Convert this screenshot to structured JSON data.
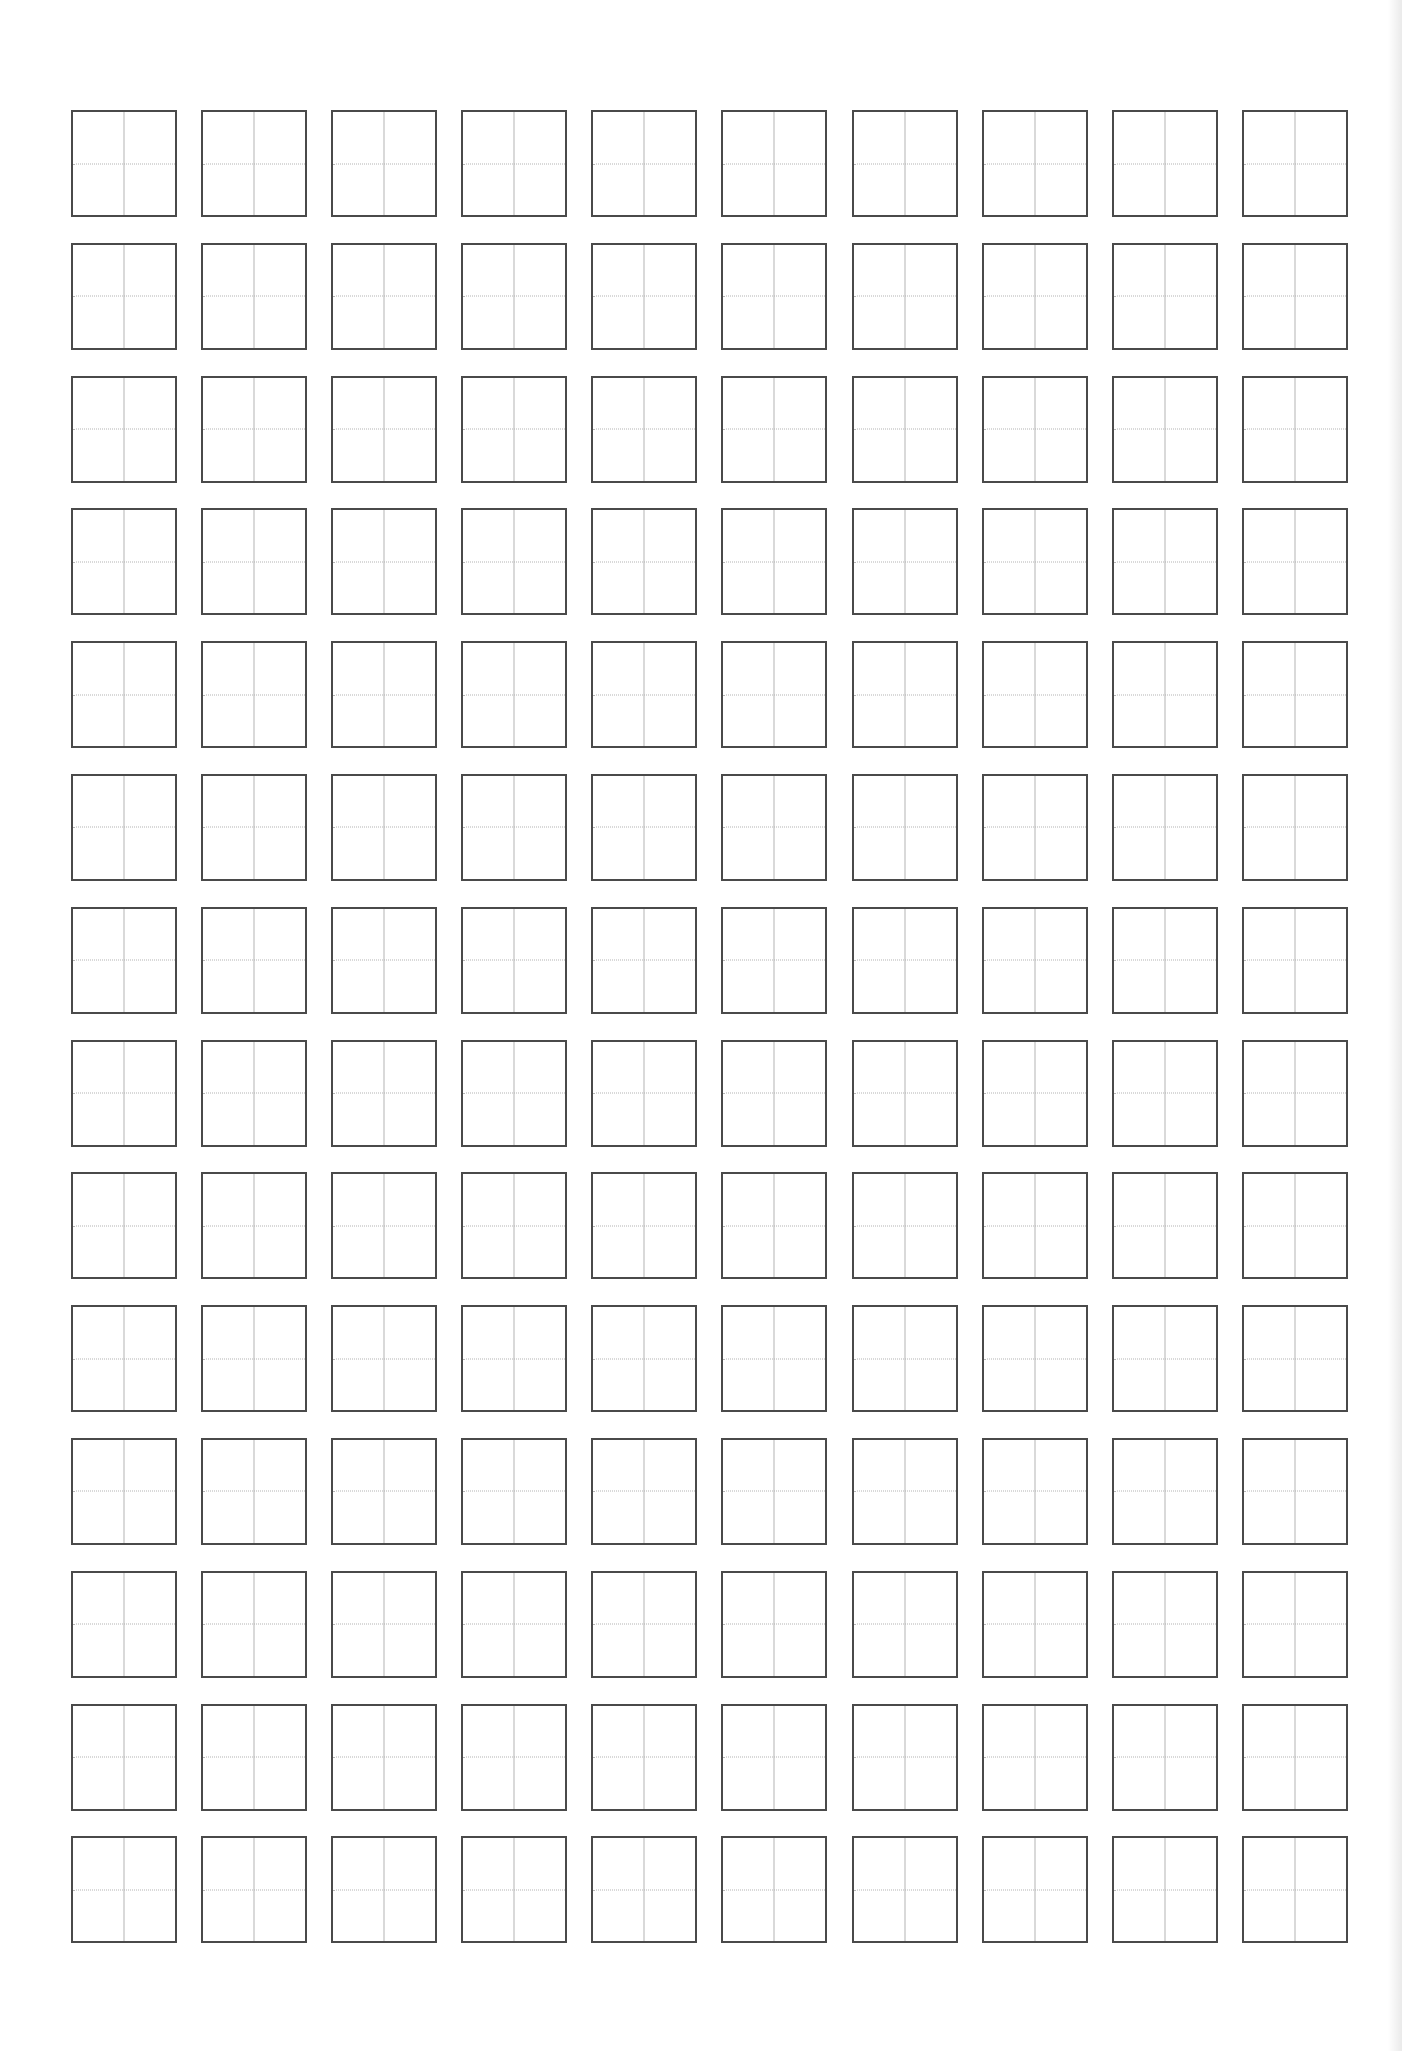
{
  "document": {
    "type": "tianzige-practice-sheet",
    "grid": {
      "columns": 10,
      "rows": 14,
      "cell_style": "square-with-center-cross",
      "cells_filled": 0
    },
    "colors": {
      "background": "#ffffff",
      "cell_border": "#4a4a4a",
      "guide_line": "#b4b4b4"
    }
  }
}
